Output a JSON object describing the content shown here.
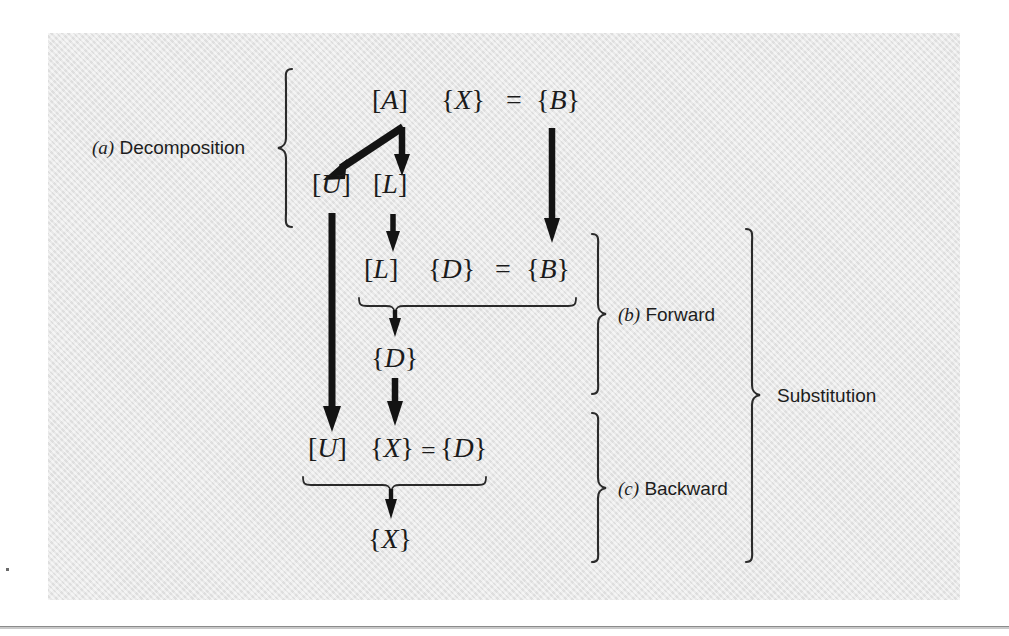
{
  "figure": {
    "type": "flow-diagram",
    "panel_background": "#e4e4e4",
    "ink_color": "#1b1b1b",
    "caption_font_color": "#1d1d1d",
    "stages": [
      {
        "key": "a",
        "tag": "(a)",
        "label": "Decomposition"
      },
      {
        "key": "b",
        "tag": "(b)",
        "label": "Forward"
      },
      {
        "key": "c",
        "tag": "(c)",
        "label": "Backward"
      }
    ],
    "group_label": "Substitution",
    "equations": {
      "original": {
        "matrix": "[A]",
        "unknown": "{X}",
        "equals": "=",
        "rhs": "{B}"
      },
      "factors": {
        "upper": "[U]",
        "lower": "[L]"
      },
      "forward": {
        "matrix": "[L]",
        "unknown": "{D}",
        "equals": "=",
        "rhs": "{B}",
        "result": "{D}"
      },
      "backward": {
        "matrix": "[U]",
        "unknown": "{X}",
        "equals": "=",
        "rhs": "{D}",
        "result": "{X}"
      }
    },
    "tokens": {
      "bracket_open": "[",
      "bracket_close": "]",
      "brace_open": "{",
      "brace_close": "}",
      "equals": "=",
      "A": "A",
      "B": "B",
      "D": "D",
      "L": "L",
      "U": "U",
      "X": "X",
      "tag_a": "(a)",
      "tag_b": "(b)",
      "tag_c": "(c)",
      "label_a": "Decomposition",
      "label_b": "Forward",
      "label_c": "Backward",
      "label_group": "Substitution"
    }
  }
}
